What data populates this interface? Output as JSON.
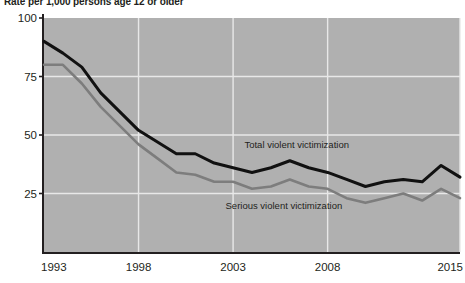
{
  "chart_data": {
    "type": "line",
    "title": "Rate per 1,000 persons age 12 or older",
    "xlabel": "",
    "ylabel": "",
    "xlim": [
      1993,
      2015
    ],
    "ylim": [
      0,
      100
    ],
    "yticks": [
      "25",
      "50",
      "75",
      "100"
    ],
    "ytick_values": [
      25,
      50,
      75,
      100
    ],
    "xticks": [
      "1993",
      "1998",
      "2003",
      "2008",
      "2015"
    ],
    "xtick_values": [
      1993,
      1998,
      2003,
      2008,
      2015
    ],
    "grid": "horizontal-and-vertical",
    "legend_position": "inline-annotations",
    "plot_background": "#b0b0b0",
    "gridline_color": "#e8e8e8",
    "x": [
      1993,
      1994,
      1995,
      1996,
      1997,
      1998,
      1999,
      2000,
      2001,
      2002,
      2003,
      2004,
      2005,
      2006,
      2007,
      2008,
      2009,
      2010,
      2011,
      2012,
      2013,
      2014,
      2015
    ],
    "series": [
      {
        "name": "Total violent victimization",
        "color": "#111111",
        "label": "Total violent victimization",
        "label_x": 2003.6,
        "label_y": 44.5,
        "values": [
          90,
          85,
          79,
          68,
          60,
          52,
          47,
          42,
          42,
          38,
          36,
          34,
          36,
          39,
          36,
          34,
          31,
          28,
          30,
          31,
          30,
          37,
          32
        ]
      },
      {
        "name": "Serious violent victimization",
        "color": "#7d7d7d",
        "label": "Serious violent victimization",
        "label_x": 2002.6,
        "label_y": 18.5,
        "values": [
          80,
          80,
          72,
          62,
          54,
          46,
          40,
          34,
          33,
          30,
          30,
          27,
          28,
          31,
          28,
          27,
          23,
          21,
          23,
          25,
          22,
          27,
          23
        ]
      }
    ]
  }
}
